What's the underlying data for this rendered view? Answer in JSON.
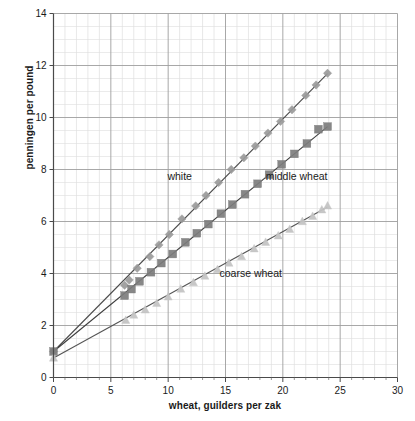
{
  "chart_data": {
    "type": "scatter",
    "title": "",
    "xlabel": "wheat, guilders per zak",
    "ylabel": "penningen per pound",
    "xlim": [
      0,
      30
    ],
    "ylim": [
      0,
      14
    ],
    "xticks": [
      0,
      5,
      10,
      15,
      20,
      25,
      30
    ],
    "yticks": [
      0,
      2,
      4,
      6,
      8,
      10,
      12,
      14
    ],
    "xtick_labels": [
      "0",
      "5",
      "10",
      "15",
      "20",
      "25",
      "30"
    ],
    "ytick_labels": [
      "0",
      "2",
      "4",
      "6",
      "8",
      "10",
      "12",
      "14"
    ],
    "grid": true,
    "minor_grid": true,
    "x_minor_step": 1,
    "y_minor_step": 0.5,
    "legend": "inline-annotations",
    "annotations": [
      {
        "text": "white",
        "x": 11.0,
        "y": 7.6
      },
      {
        "text": "middle wheat",
        "x": 21.2,
        "y": 7.6
      },
      {
        "text": "coarse wheat",
        "x": 17.2,
        "y": 3.85
      }
    ],
    "series": [
      {
        "name": "white",
        "marker": "diamond",
        "color": "#9a9a9a",
        "line_color": "#4a4a4a",
        "intercept": 1.0,
        "slope": 0.447,
        "points": [
          {
            "x": 0.0,
            "y": 1.0
          },
          {
            "x": 6.2,
            "y": 3.55
          },
          {
            "x": 6.6,
            "y": 3.75
          },
          {
            "x": 7.3,
            "y": 4.2
          },
          {
            "x": 8.4,
            "y": 4.65
          },
          {
            "x": 9.2,
            "y": 5.1
          },
          {
            "x": 10.1,
            "y": 5.5
          },
          {
            "x": 11.2,
            "y": 6.1
          },
          {
            "x": 12.4,
            "y": 6.6
          },
          {
            "x": 13.3,
            "y": 7.0
          },
          {
            "x": 14.4,
            "y": 7.5
          },
          {
            "x": 15.5,
            "y": 8.0
          },
          {
            "x": 16.6,
            "y": 8.45
          },
          {
            "x": 17.6,
            "y": 8.9
          },
          {
            "x": 18.7,
            "y": 9.4
          },
          {
            "x": 19.8,
            "y": 9.85
          },
          {
            "x": 20.8,
            "y": 10.3
          },
          {
            "x": 22.0,
            "y": 10.85
          },
          {
            "x": 22.9,
            "y": 11.25
          },
          {
            "x": 23.9,
            "y": 11.7
          }
        ]
      },
      {
        "name": "middle wheat",
        "marker": "square",
        "color": "#7d7d7d",
        "line_color": "#3d3d3d",
        "intercept": 1.0,
        "slope": 0.362,
        "points": [
          {
            "x": 0.0,
            "y": 1.0
          },
          {
            "x": 6.2,
            "y": 3.15
          },
          {
            "x": 6.8,
            "y": 3.4
          },
          {
            "x": 7.5,
            "y": 3.7
          },
          {
            "x": 8.5,
            "y": 4.05
          },
          {
            "x": 9.4,
            "y": 4.4
          },
          {
            "x": 10.4,
            "y": 4.75
          },
          {
            "x": 11.5,
            "y": 5.2
          },
          {
            "x": 12.5,
            "y": 5.55
          },
          {
            "x": 13.5,
            "y": 5.9
          },
          {
            "x": 14.6,
            "y": 6.3
          },
          {
            "x": 15.6,
            "y": 6.65
          },
          {
            "x": 16.7,
            "y": 7.05
          },
          {
            "x": 17.8,
            "y": 7.45
          },
          {
            "x": 18.8,
            "y": 7.8
          },
          {
            "x": 19.9,
            "y": 8.2
          },
          {
            "x": 21.0,
            "y": 8.6
          },
          {
            "x": 22.1,
            "y": 9.0
          },
          {
            "x": 23.1,
            "y": 9.55
          },
          {
            "x": 23.9,
            "y": 9.65
          }
        ]
      },
      {
        "name": "coarse wheat",
        "marker": "triangle",
        "color": "#c4c4c4",
        "line_color": "#555555",
        "intercept": 0.75,
        "slope": 0.243,
        "points": [
          {
            "x": 0.0,
            "y": 0.75
          },
          {
            "x": 6.3,
            "y": 2.2
          },
          {
            "x": 7.0,
            "y": 2.4
          },
          {
            "x": 8.0,
            "y": 2.6
          },
          {
            "x": 9.0,
            "y": 2.85
          },
          {
            "x": 10.0,
            "y": 3.1
          },
          {
            "x": 11.1,
            "y": 3.4
          },
          {
            "x": 12.2,
            "y": 3.65
          },
          {
            "x": 13.2,
            "y": 3.9
          },
          {
            "x": 14.3,
            "y": 4.15
          },
          {
            "x": 15.3,
            "y": 4.4
          },
          {
            "x": 16.4,
            "y": 4.65
          },
          {
            "x": 17.5,
            "y": 4.95
          },
          {
            "x": 18.5,
            "y": 5.2
          },
          {
            "x": 19.6,
            "y": 5.45
          },
          {
            "x": 20.6,
            "y": 5.7
          },
          {
            "x": 21.7,
            "y": 6.0
          },
          {
            "x": 22.6,
            "y": 6.2
          },
          {
            "x": 23.4,
            "y": 6.45
          },
          {
            "x": 23.9,
            "y": 6.6
          }
        ]
      }
    ]
  }
}
